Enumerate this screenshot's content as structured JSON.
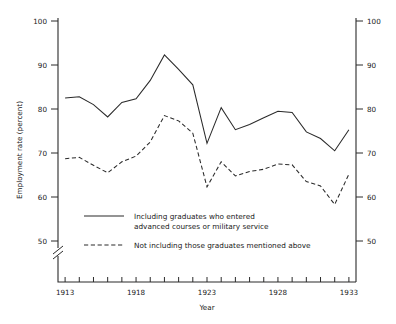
{
  "chart_data": {
    "type": "line",
    "title": "",
    "xlabel": "Year",
    "ylabel": "Employment rate (percent)",
    "xlim": [
      1912.5,
      1933.5
    ],
    "ylim": [
      48,
      100
    ],
    "y_axis_break": true,
    "grid": false,
    "legend_position": "inside-lower-left",
    "x_tick_labels": [
      "1913",
      "1918",
      "1923",
      "1928",
      "1933"
    ],
    "x_tick_values": [
      1913,
      1918,
      1923,
      1928,
      1933
    ],
    "x_minor_ticks": [
      1913,
      1914,
      1915,
      1916,
      1917,
      1918,
      1919,
      1920,
      1921,
      1922,
      1923,
      1924,
      1925,
      1926,
      1927,
      1928,
      1929,
      1930,
      1931,
      1932,
      1933
    ],
    "y_tick_labels": [
      "50",
      "60",
      "70",
      "80",
      "90",
      "100"
    ],
    "y_tick_values": [
      50,
      60,
      70,
      80,
      90,
      100
    ],
    "x": [
      1913,
      1914,
      1915,
      1916,
      1917,
      1918,
      1919,
      1920,
      1921,
      1922,
      1923,
      1924,
      1925,
      1926,
      1927,
      1928,
      1929,
      1930,
      1931,
      1932,
      1933
    ],
    "series": [
      {
        "name": "Including graduates who entered advanced courses or military service",
        "style": "solid",
        "values": [
          82.5,
          82.8,
          81.0,
          78.2,
          81.5,
          82.3,
          86.5,
          92.3,
          89.0,
          85.5,
          72.2,
          80.3,
          75.3,
          76.5,
          78.0,
          79.5,
          79.2,
          74.8,
          73.3,
          70.5,
          75.3
        ]
      },
      {
        "name": "Not including those graduates mentioned above",
        "style": "dashed",
        "values": [
          68.7,
          69.0,
          67.2,
          65.5,
          68.0,
          69.3,
          72.5,
          78.5,
          77.3,
          74.5,
          62.3,
          68.0,
          64.8,
          65.8,
          66.3,
          67.5,
          67.3,
          63.5,
          62.5,
          58.3,
          65.2
        ]
      }
    ],
    "legend": [
      {
        "style": "solid",
        "line1": "Including graduates who entered",
        "line2": "advanced courses or military service"
      },
      {
        "style": "dashed",
        "line1": "Not including those graduates mentioned above",
        "line2": ""
      }
    ]
  }
}
